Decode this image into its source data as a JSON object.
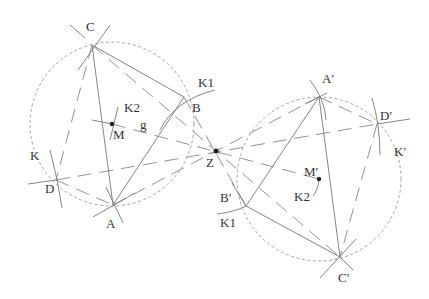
{
  "diagram": {
    "left_figure": {
      "points": {
        "C": {
          "label": "C",
          "x": 92,
          "y": 45
        },
        "B": {
          "label": "B",
          "x": 184,
          "y": 97
        },
        "A": {
          "label": "A",
          "x": 113,
          "y": 205
        },
        "D": {
          "label": "D",
          "x": 56,
          "y": 180
        },
        "M": {
          "label": "M",
          "x": 112,
          "y": 124
        }
      },
      "circle": {
        "label": "K",
        "cx": 112,
        "cy": 124,
        "r": 82
      },
      "labels": {
        "K1": "K1",
        "K2": "K2",
        "g": "g",
        "K": "K"
      }
    },
    "center": {
      "label": "Z",
      "x": 216,
      "y": 151
    },
    "right_figure": {
      "points": {
        "A_prime": {
          "label": "A′",
          "x": 319,
          "y": 97
        },
        "D_prime": {
          "label": "D′",
          "x": 377,
          "y": 124
        },
        "B_prime": {
          "label": "B′",
          "x": 246,
          "y": 206
        },
        "C_prime": {
          "label": "C′",
          "x": 340,
          "y": 257
        },
        "M_prime": {
          "label": "M′",
          "x": 319,
          "y": 179
        }
      },
      "circle": {
        "label": "K′",
        "cx": 319,
        "cy": 179,
        "r": 82
      },
      "labels": {
        "K1": "K1",
        "K2": "K2",
        "K_prime": "K′"
      }
    }
  }
}
